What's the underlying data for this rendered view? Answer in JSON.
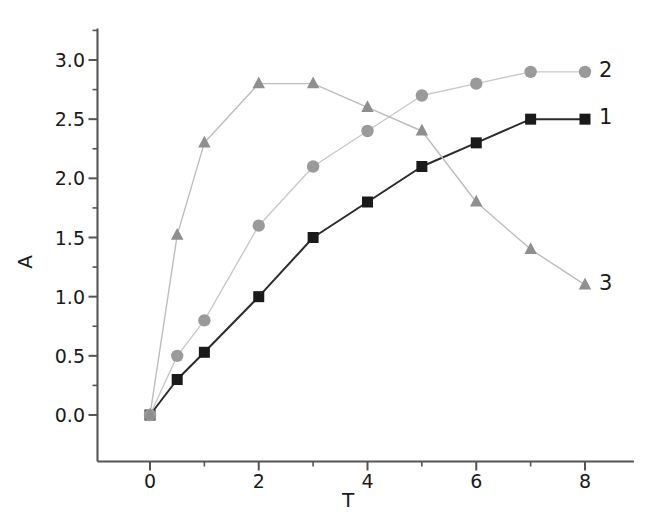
{
  "chart_data": {
    "type": "line",
    "title": "",
    "xlabel": "T",
    "ylabel": "A",
    "xlim": [
      -0.6,
      8.9
    ],
    "ylim": [
      -0.28,
      3.25
    ],
    "grid": false,
    "legend_position": "right-of-curve-ends",
    "x_ticks": [
      "0",
      "2",
      "4",
      "6",
      "8"
    ],
    "x_tick_values": [
      0,
      2,
      4,
      6,
      8
    ],
    "x_minor_tick_values": [
      1,
      3,
      5,
      7
    ],
    "y_ticks": [
      "0.0",
      "0.5",
      "1.0",
      "1.5",
      "2.0",
      "2.5",
      "3.0"
    ],
    "y_tick_values": [
      0.0,
      0.5,
      1.0,
      1.5,
      2.0,
      2.5,
      3.0
    ],
    "y_minor_tick_values": [
      0.25,
      0.75,
      1.25,
      1.75,
      2.25,
      2.75,
      3.25
    ],
    "series": [
      {
        "name": "1",
        "marker": "square",
        "color": "#1a1a1a",
        "line_color": "#2b2b2b",
        "x": [
          0,
          0.5,
          1,
          2,
          3,
          4,
          5,
          6,
          7,
          8
        ],
        "values": [
          0.0,
          0.3,
          0.53,
          1.0,
          1.5,
          1.8,
          2.1,
          2.3,
          2.5,
          2.5
        ]
      },
      {
        "name": "2",
        "marker": "circle",
        "color": "#9a9a9a",
        "line_color": "#c9c9c9",
        "x": [
          0,
          0.5,
          1,
          2,
          3,
          4,
          5,
          6,
          7,
          8
        ],
        "values": [
          0.0,
          0.5,
          0.8,
          1.6,
          2.1,
          2.4,
          2.7,
          2.8,
          2.9,
          2.9
        ]
      },
      {
        "name": "3",
        "marker": "triangle",
        "color": "#8f8f8f",
        "line_color": "#bdbdbd",
        "x": [
          0,
          0.5,
          1,
          2,
          3,
          4,
          5,
          6,
          7,
          8
        ],
        "values": [
          0.0,
          1.52,
          2.3,
          2.8,
          2.8,
          2.6,
          2.4,
          1.8,
          1.4,
          1.1
        ]
      }
    ],
    "series_end_labels": [
      {
        "text": "1",
        "x": 8,
        "y": 2.5
      },
      {
        "text": "2",
        "x": 8,
        "y": 2.9
      },
      {
        "text": "3",
        "x": 8,
        "y": 1.1
      }
    ],
    "axis_color": "#555555"
  }
}
